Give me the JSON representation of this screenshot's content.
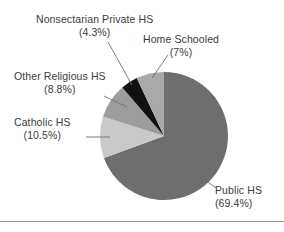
{
  "chart_data": {
    "type": "pie",
    "title": "",
    "xlabel": "",
    "ylabel": "",
    "legend_position": "callout-labels",
    "grid": false,
    "start_angle_deg": 0,
    "direction": "clockwise",
    "categories": [
      "Public HS",
      "Catholic HS",
      "Other Religious HS",
      "Nonsectarian Private HS",
      "Home Schooled"
    ],
    "values": [
      69.4,
      10.5,
      8.8,
      4.3,
      7
    ],
    "units": "percent",
    "slices": [
      {
        "label": "Public HS",
        "percent_text": "(69.4%)",
        "value": 69.4,
        "color": "#6e6e6e"
      },
      {
        "label": "Catholic HS",
        "percent_text": "(10.5%)",
        "value": 10.5,
        "color": "#c9c9c9"
      },
      {
        "label": "Other Religious HS",
        "percent_text": "(8.8%)",
        "value": 8.8,
        "color": "#9d9d9d"
      },
      {
        "label": "Nonsectarian Private HS",
        "percent_text": "(4.3%)",
        "value": 4.3,
        "color": "#111111"
      },
      {
        "label": "Home Schooled",
        "percent_text": "(7%)",
        "value": 7,
        "color": "#a9a9a9"
      }
    ]
  },
  "figure": {
    "background_color": "#ffffff",
    "leader_line_color": "#6f6f6f",
    "rule_color": "#9b9b9b",
    "text_color": "#3b3b3b"
  }
}
